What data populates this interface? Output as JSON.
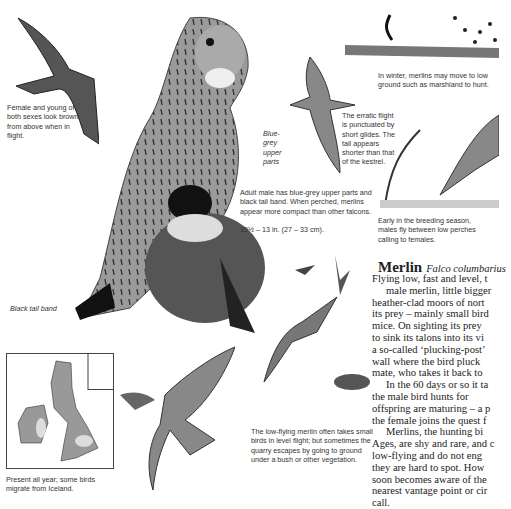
{
  "captions": {
    "female_young": "Female and young of both sexes look brown from above when in flight.",
    "blue_grey": "Blue-grey upper parts",
    "adult_male": "Adult male has blue-grey upper parts and black tail band. When perched, merlins appear more compact than other falcons.",
    "size": "10½ – 13 in. (27 – 33 cm).",
    "black_tail": "Black tail band",
    "erratic": "The erratic flight is punctuated by short glides. The tail appears shorter than that of the kestrel.",
    "winter": "In winter, merlins may move to low ground such as marshland to hunt.",
    "breeding": "Early in the breeding season, males fly between low perches calling to females.",
    "low_flying": "The low-flying merlin often takes small birds in level flight; but sometimes the quarry escapes by going to ground under a bush or other vegetation.",
    "map": "Present all year; some birds migrate from Iceland."
  },
  "article": {
    "title": "Merlin",
    "scientific": "Falco columbarius",
    "lines_p1": [
      "Flying low, fast and level, t",
      "male merlin, little bigger",
      "heather-clad moors of nort",
      "its prey – mainly small bird",
      "mice. On sighting its prey",
      "to sink its talons into its vi",
      "a so-called ‘plucking-post’",
      "wall where the bird pluck",
      "mate, who takes it back to"
    ],
    "lines_p2": [
      "In the 60 days or so it ta",
      "the male bird hunts for",
      "offspring are maturing – a p",
      "the female joins the quest f"
    ],
    "lines_p3": [
      "Merlins, the hunting bi",
      "Ages, are shy and rare, and c",
      "low-flying and do not eng",
      "they are hard to spot. How",
      "soon becomes aware of the",
      "nearest vantage point or cir",
      "call."
    ]
  }
}
